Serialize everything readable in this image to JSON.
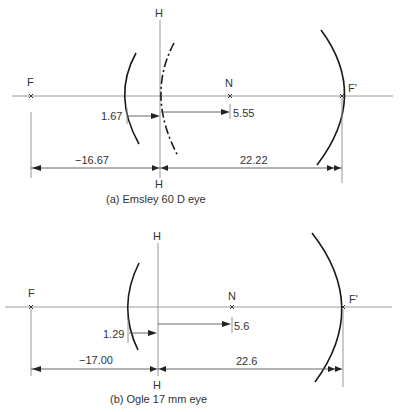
{
  "diagrams": [
    {
      "id": "a",
      "caption": "(a)  Emsley 60 D eye",
      "labels": {
        "principal_plane_top": "H",
        "principal_plane_bottom": "H",
        "first_focal_point": "F",
        "nodal_point": "N",
        "second_focal_point": "F'"
      },
      "dimensions": {
        "cornea_to_principal_plane": "1.67",
        "principal_to_nodal": "5.55",
        "anterior_focal_length": "−16.67",
        "posterior_focal_length": "22.22"
      },
      "values_mm": {
        "cornea_to_H": 1.67,
        "H_to_N": 5.55,
        "F_to_H": -16.67,
        "H_to_F_prime": 22.22
      },
      "has_dashed_surface": true
    },
    {
      "id": "b",
      "caption": "(b)  Ogle 17 mm eye",
      "labels": {
        "principal_plane_top": "H",
        "principal_plane_bottom": "H",
        "first_focal_point": "F",
        "nodal_point": "N",
        "second_focal_point": "F'"
      },
      "dimensions": {
        "cornea_to_principal_plane": "1.29",
        "principal_to_nodal": "5.6",
        "anterior_focal_length": "−17.00",
        "posterior_focal_length": "22.6"
      },
      "values_mm": {
        "cornea_to_H": 1.29,
        "H_to_N": 5.6,
        "F_to_H": -17.0,
        "H_to_F_prime": 22.6
      },
      "has_dashed_surface": false
    }
  ]
}
